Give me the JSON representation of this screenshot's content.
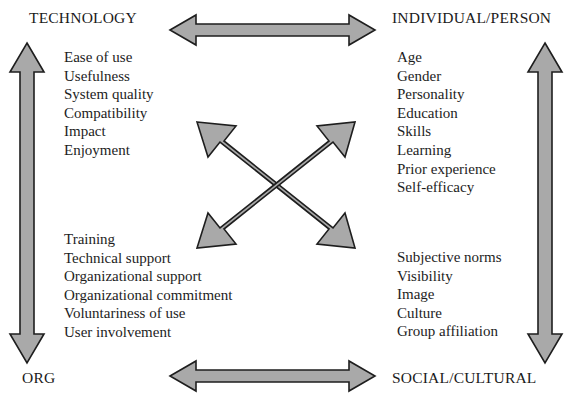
{
  "diagram": {
    "background_color": "#ffffff",
    "arrow_fill_color": "#a9a9a9",
    "arrow_stroke_color": "#1e1e1e",
    "text_color": "#1a1a1a"
  },
  "quadrants": {
    "technology": {
      "label": "TECHNOLOGY",
      "items": [
        "Ease of use",
        "Usefulness",
        "System quality",
        "Compatibility",
        "Impact",
        "Enjoyment"
      ]
    },
    "individual": {
      "label": "INDIVIDUAL/PERSON",
      "items": [
        "Age",
        "Gender",
        "Personality",
        "Education",
        "Skills",
        "Learning",
        "Prior experience",
        "Self-efficacy"
      ]
    },
    "organizational": {
      "label": "ORG",
      "items": [
        "Training",
        "Technical support",
        "Organizational support",
        "Organizational commitment",
        "Voluntariness of use",
        "User involvement"
      ]
    },
    "social": {
      "label": "SOCIAL/CULTURAL",
      "items": [
        "Subjective norms",
        "Visibility",
        "Image",
        "Culture",
        "Group affiliation"
      ]
    }
  },
  "connectors": [
    {
      "name": "top-horizontal-double-arrow",
      "from": "TECHNOLOGY",
      "to": "INDIVIDUAL/PERSON",
      "style": "double-headed"
    },
    {
      "name": "bottom-horizontal-double-arrow",
      "from": "ORG",
      "to": "SOCIAL/CULTURAL",
      "style": "double-headed"
    },
    {
      "name": "left-vertical-double-arrow",
      "from": "TECHNOLOGY",
      "to": "ORG",
      "style": "double-headed"
    },
    {
      "name": "right-vertical-double-arrow",
      "from": "INDIVIDUAL/PERSON",
      "to": "SOCIAL/CULTURAL",
      "style": "double-headed"
    },
    {
      "name": "diagonal-double-arrow-nw-se",
      "from": "TECHNOLOGY",
      "to": "SOCIAL/CULTURAL",
      "style": "double-headed"
    },
    {
      "name": "diagonal-double-arrow-ne-sw",
      "from": "INDIVIDUAL/PERSON",
      "to": "ORG",
      "style": "double-headed"
    }
  ]
}
